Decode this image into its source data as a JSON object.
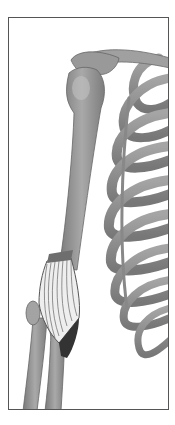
{
  "figure": {
    "parts": [
      "clavicle",
      "scapula-acromion",
      "humerus",
      "rib-cage",
      "forearm-radius",
      "forearm-ulna",
      "brachioradialis-muscle-fibers",
      "tendon-dark-region"
    ],
    "colors": {
      "bone": "#8f8f8f",
      "bone_light": "#b5b5b5",
      "bone_dark": "#6a6a6a",
      "muscle_dark": "#3a3a3a",
      "frame": "#555555",
      "background": "#ffffff"
    }
  }
}
